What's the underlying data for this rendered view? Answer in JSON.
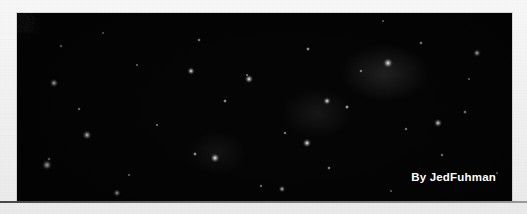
{
  "page": {
    "background_color": "#f1f1f1",
    "scan_edge_color": "#3b3b3b"
  },
  "caption": {
    "text": "DEEP FIELD SURVEY",
    "color": "#c9c9c9",
    "note": "cropped at top edge, only lower pixel rows of glyphs visible"
  },
  "photo": {
    "subject": "deep-field star and galaxy cluster photograph",
    "background_color": "#050505",
    "star_color": "#ffffff",
    "left": 17,
    "top": 13,
    "width": 495,
    "height": 188
  },
  "byline": {
    "text": "By JedFuhman",
    "color": "#ffffff"
  }
}
